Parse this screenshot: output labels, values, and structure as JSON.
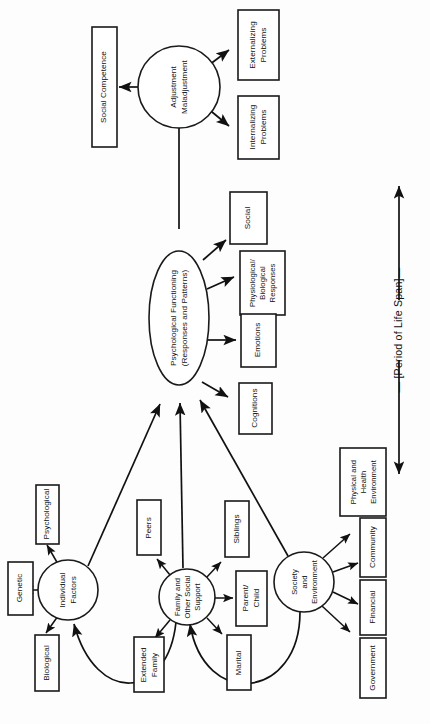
{
  "figure": {
    "orientation": "rotated-90-ccw",
    "background_color": "#fdfdfd",
    "line_color": "#111111",
    "box_fill": "#ffffff",
    "timeline_label": "— [Period of Life Span]—"
  },
  "nodes": {
    "adjustment": {
      "id": "adjustment",
      "shape": "circle",
      "line1": "Adjustment",
      "line2": "Maladjustment"
    },
    "psych_functioning": {
      "id": "psych_functioning",
      "shape": "ellipse",
      "line1": "Psychological Functioning",
      "line2": "(Responses and Patterns)"
    },
    "individual": {
      "id": "individual",
      "shape": "circle",
      "line1": "Individual",
      "line2": "Factors"
    },
    "family": {
      "id": "family",
      "shape": "circle",
      "line1": "Family and",
      "line2": "Other Social",
      "line3": "Support"
    },
    "society": {
      "id": "society",
      "shape": "circle",
      "line1": "Society",
      "line2": "and",
      "line3": "Environment"
    }
  },
  "outcome_boxes": [
    {
      "id": "social_competence",
      "label": "Social Competence"
    },
    {
      "id": "externalizing_problems",
      "line1": "Externalizing",
      "line2": "Problems"
    },
    {
      "id": "internalizing_problems",
      "line1": "Internalizing",
      "line2": "Problems"
    }
  ],
  "functioning_boxes": [
    {
      "id": "social",
      "label": "Social"
    },
    {
      "id": "physiological_biological_responses",
      "line1": "Physiological/",
      "line2": "Biological",
      "line3": "Responses"
    },
    {
      "id": "emotions",
      "label": "Emotions"
    },
    {
      "id": "cognitions",
      "label": "Cognitions"
    }
  ],
  "individual_boxes": [
    {
      "id": "psychological",
      "label": "Psychological"
    },
    {
      "id": "genetic",
      "label": "Genetic"
    },
    {
      "id": "biological",
      "label": "Biological"
    }
  ],
  "family_boxes": [
    {
      "id": "peers",
      "label": "Peers"
    },
    {
      "id": "siblings",
      "label": "Siblings"
    },
    {
      "id": "parent_child",
      "line1": "Parent/",
      "line2": "Child"
    },
    {
      "id": "marital",
      "label": "Marital"
    },
    {
      "id": "extended_family",
      "line1": "Extended",
      "line2": "Family"
    }
  ],
  "society_boxes": [
    {
      "id": "physical_health_environment",
      "line1": "Physical  and",
      "line2": "Health",
      "line3": "Environment"
    },
    {
      "id": "community",
      "label": "Community"
    },
    {
      "id": "financial",
      "label": "Financial"
    },
    {
      "id": "government",
      "label": "Government"
    }
  ]
}
